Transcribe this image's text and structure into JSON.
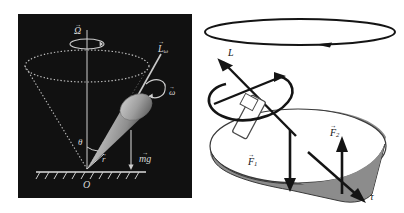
{
  "figure": {
    "panels": [
      "left-dark-top-panel",
      "right-gyroscope-panel"
    ]
  },
  "left": {
    "background_color": "#111111",
    "ink_color": "#d8d8d8",
    "body_color": "#9a9a9a",
    "labels": {
      "precession": "Ω",
      "angular_momentum": "L",
      "angular_momentum_sub": "ω",
      "spin": "ω",
      "angle": "θ",
      "radius": "r",
      "weight": "mg",
      "origin": "O"
    },
    "elements": [
      "vertical-precession-axis",
      "precession-circle-arrow",
      "dotted-precession-cone",
      "dotted-precession-ellipse",
      "spinning-top-body",
      "spin-axis-rod",
      "spin-curved-arrow",
      "angle-arc",
      "weight-vector",
      "hatched-ground-line"
    ]
  },
  "right": {
    "background_color": "#ffffff",
    "ink_color": "#111111",
    "shade_color": "#8c8c8c",
    "labels": {
      "angular_momentum": "L",
      "force_one": "F",
      "force_one_sub": "1",
      "force_two": "F",
      "force_two_sub": "2",
      "torque": "τ"
    },
    "elements": [
      "precession-ellipse-with-arrow",
      "angular-momentum-vector",
      "gyroscope-housing",
      "gyroscope-rod",
      "spin-curved-arrow",
      "shaded-cone-surface",
      "force-one-vector",
      "force-two-vector",
      "torque-vector"
    ]
  }
}
